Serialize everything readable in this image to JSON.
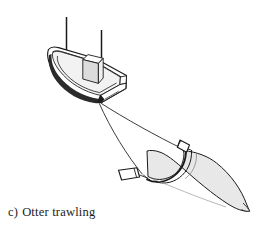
{
  "figure": {
    "caption_label": "c)",
    "caption_text": "Otter trawling",
    "caption_full": "c) Otter trawling",
    "background_color": "#ffffff",
    "line_color": "#1a1a1a",
    "net_fill_color": "#e8e8e8",
    "hull_fill_color": "#ffffff",
    "hull_shadow_color": "#2b2b2b",
    "cabin_side_color": "#d9d9d9",
    "deck_fill_color": "#f2f2f2"
  },
  "parts": {
    "vessel": {
      "name": "fishing vessel",
      "hull": "hull",
      "deck": "deck",
      "keel_shadow": "keel shadow",
      "wheelhouse": "wheelhouse",
      "mast_fore": "fore mast",
      "mast_main": "main mast"
    },
    "warps": {
      "name": "warp cables",
      "warp_upper": "upper warp",
      "warp_lower": "lower warp"
    },
    "otter_boards": {
      "name": "otter boards",
      "board_upper": "upper otter board",
      "board_lower": "lower otter board"
    },
    "net": {
      "name": "trawl net",
      "mouth": "net mouth",
      "body": "net body",
      "cod_end": "cod end"
    }
  }
}
